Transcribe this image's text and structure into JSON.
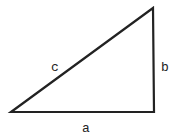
{
  "diagram": {
    "type": "right-triangle",
    "stroke_color": "#222222",
    "background": "#ffffff",
    "vertices": {
      "left": [
        11,
        112
      ],
      "top_right": [
        153,
        8
      ],
      "bottom_right": [
        154,
        112
      ]
    },
    "sides": [
      {
        "name": "a",
        "label": "a",
        "description": "bottom horizontal side"
      },
      {
        "name": "b",
        "label": "b",
        "description": "right vertical side"
      },
      {
        "name": "c",
        "label": "c",
        "description": "hypotenuse"
      }
    ]
  }
}
